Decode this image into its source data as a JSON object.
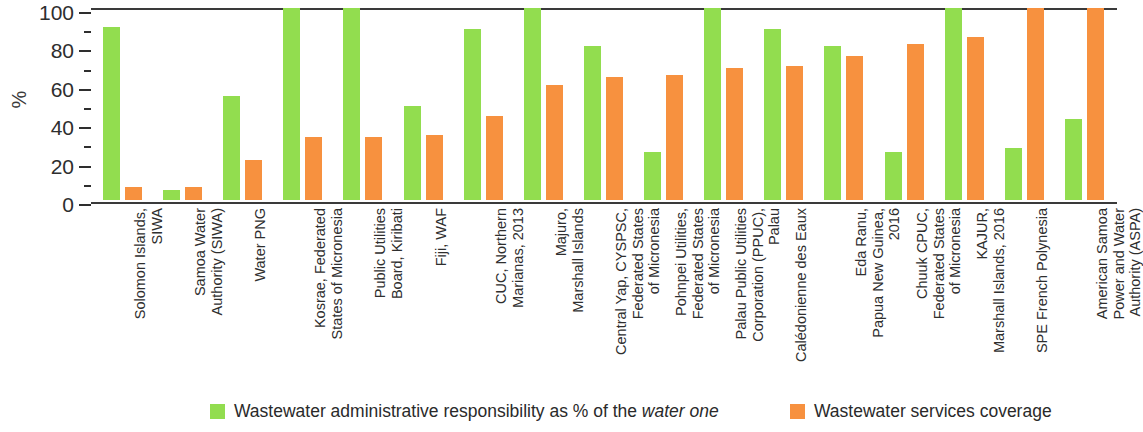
{
  "chart_data": {
    "type": "bar",
    "title": "",
    "subtitle": "",
    "xlabel": "",
    "ylabel": "%",
    "ylim": [
      0,
      100
    ],
    "yticks": [
      0,
      20,
      40,
      60,
      80,
      100
    ],
    "yminorticks": [
      10,
      30,
      50,
      70,
      90
    ],
    "grid": false,
    "legend_position": "bottom",
    "categories": [
      "Solomon Islands,\nSIWA",
      "Samoa Water\nAuthority (SIWA)",
      "Water PNG",
      "Kosrae, Federated\nStates of Micronesia",
      "Public Utilities\nBoard, Kiribati",
      "Fiji, WAF",
      "CUC, Northern\nMarianas, 2013",
      "Majuro,\nMarshall Islands",
      "Central Yap, CYSPSC,\nFederated States\nof Micronesia",
      "Pohnpei Utilities,\nFederated States\nof Micronesia",
      "Palau Public Utilities\nCorporation (PPUC),\nPalau",
      "Calédonienne des Eaux",
      "Eda Ranu,\nPapua New Guinea,\n2016",
      "Chuuk CPUC,\nFederated States\nof Micronesia",
      "KAJUR,\nMarshall Islands, 2016",
      "SPE French Polynesia",
      "American Samoa\nPower and Water\nAuthority (ASPA)"
    ],
    "series": [
      {
        "name": "Wastewater administrative responsibility as % of the water one",
        "color": "#92dd4f",
        "values": [
          90,
          5,
          54,
          100,
          100,
          49,
          89,
          100,
          80,
          25,
          100,
          89,
          80,
          25,
          100,
          27,
          42
        ]
      },
      {
        "name": "Wastewater services coverage",
        "color": "#f7913f",
        "values": [
          7,
          7,
          21,
          33,
          33,
          34,
          44,
          60,
          64,
          65,
          69,
          70,
          75,
          81,
          85,
          100,
          100
        ]
      }
    ]
  },
  "axis": {
    "y_title": "%",
    "y_tick_labels": [
      "100",
      "80",
      "60",
      "40",
      "20",
      "0"
    ]
  },
  "legend": {
    "items": [
      {
        "swatch": "green",
        "text_plain": "Wastewater administrative responsibility as % of the ",
        "text_italic": "water one",
        "full": "Wastewater administrative responsibility as % of the water one"
      },
      {
        "swatch": "orange",
        "text_plain": "Wastewater services coverage",
        "text_italic": "",
        "full": "Wastewater services coverage"
      }
    ]
  }
}
